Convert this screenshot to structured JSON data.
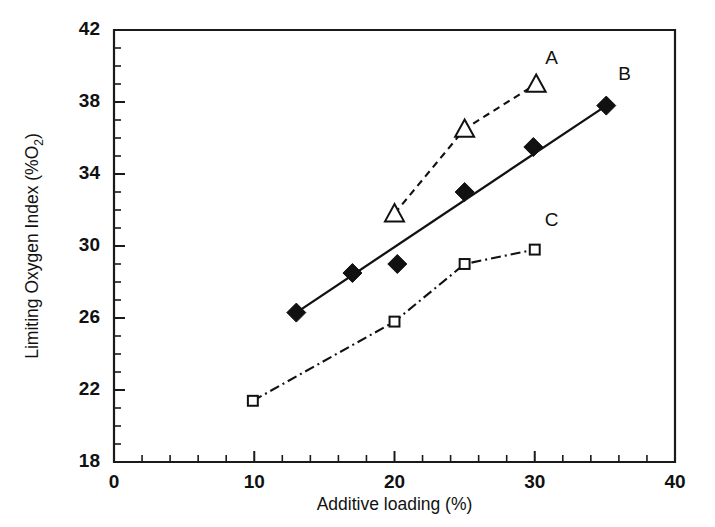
{
  "chart_data": {
    "type": "scatter",
    "title": "",
    "xlabel": "Additive loading (%)",
    "ylabel": "Limiting Oxygen Index (%O2)",
    "ylabel_main": "Limiting Oxygen Index (%O",
    "ylabel_sub": "2",
    "ylabel_tail": ")",
    "xlim": [
      0,
      40
    ],
    "ylim": [
      18,
      42
    ],
    "x_ticks": [
      0,
      10,
      20,
      30,
      40
    ],
    "x_tick_labels": [
      "0",
      "10",
      "20",
      "30",
      "40"
    ],
    "x_minor_step": 2,
    "y_ticks": [
      18,
      22,
      26,
      30,
      34,
      38,
      42
    ],
    "y_tick_labels": [
      "18",
      "22",
      "26",
      "30",
      "34",
      "38",
      "42"
    ],
    "y_minor_step": 1,
    "grid": false,
    "legend_position": "inline-end-of-line",
    "series": [
      {
        "name": "A",
        "label": "A",
        "marker": "open-triangle",
        "line_style": "dashed",
        "color": "#111111",
        "label_x": 31.2,
        "label_y": 40.1,
        "points": [
          {
            "x": 20.0,
            "y": 31.8
          },
          {
            "x": 25.0,
            "y": 36.5
          },
          {
            "x": 30.1,
            "y": 39.0
          }
        ]
      },
      {
        "name": "B",
        "label": "B",
        "marker": "filled-diamond",
        "line_style": "solid",
        "color": "#111111",
        "label_x": 36.4,
        "label_y": 39.2,
        "points": [
          {
            "x": 13.0,
            "y": 26.3
          },
          {
            "x": 17.0,
            "y": 28.5
          },
          {
            "x": 20.2,
            "y": 29.0
          },
          {
            "x": 25.0,
            "y": 33.0
          },
          {
            "x": 29.9,
            "y": 35.5
          },
          {
            "x": 35.1,
            "y": 37.8
          }
        ],
        "fit_line": [
          {
            "x": 13.0,
            "y": 26.3
          },
          {
            "x": 35.1,
            "y": 37.8
          }
        ]
      },
      {
        "name": "C",
        "label": "C",
        "marker": "open-square",
        "line_style": "dash-dot",
        "color": "#111111",
        "label_x": 31.2,
        "label_y": 31.1,
        "points": [
          {
            "x": 9.9,
            "y": 21.4
          },
          {
            "x": 20.0,
            "y": 25.8
          },
          {
            "x": 25.0,
            "y": 29.0
          },
          {
            "x": 30.0,
            "y": 29.8
          }
        ]
      }
    ]
  }
}
